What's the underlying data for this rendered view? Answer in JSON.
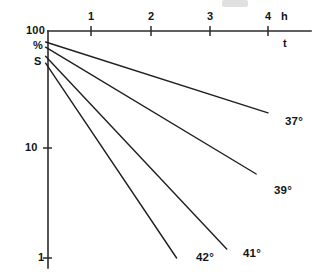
{
  "figure": {
    "kind": "semi-logarithmic-line-chart",
    "background_color": "#ffffff",
    "line_color": "#1f1f1f",
    "axis_color": "#2b2b2b",
    "top_edge_artifact": ""
  },
  "y_axis": {
    "scale": "log",
    "top_label": "100",
    "unit_label": "%",
    "quantity_label": "S",
    "tick_labels": [
      "100",
      "10",
      "1"
    ],
    "tick_values": [
      100,
      10,
      1
    ],
    "limits": [
      1,
      100
    ]
  },
  "x_axis": {
    "position": "top",
    "tick_labels": [
      "1",
      "2",
      "3",
      "4"
    ],
    "tick_values": [
      1,
      2,
      3,
      4
    ],
    "unit_label": "h",
    "variable_label": "t",
    "limits": [
      0,
      4.7
    ]
  },
  "series_labels": {
    "s37": "37°",
    "s39": "39°",
    "s41": "41°",
    "s42": "42°"
  },
  "chart_data": {
    "type": "line",
    "title": "",
    "subtitle": "",
    "xlabel": "t",
    "ylabel": "S",
    "x_unit": "h",
    "y_unit": "%",
    "yscale": "log",
    "xscale": "linear",
    "xlim": [
      0,
      4.7
    ],
    "ylim": [
      1,
      100
    ],
    "xticks": [
      1,
      2,
      3,
      4
    ],
    "yticks": [
      1,
      10,
      100
    ],
    "grid": false,
    "legend": "inline-right-end-labels",
    "x_axis_position": "top",
    "annotations": [
      "37°",
      "39°",
      "41°",
      "42°"
    ],
    "series": [
      {
        "name": "37°",
        "label": "37°",
        "x": [
          0.23,
          4.0
        ],
        "values": [
          80,
          19
        ]
      },
      {
        "name": "39°",
        "label": "39°",
        "x": [
          0.23,
          3.8
        ],
        "values": [
          72,
          5.5
        ]
      },
      {
        "name": "41°",
        "label": "41°",
        "x": [
          0.23,
          3.3
        ],
        "values": [
          60,
          1.2
        ]
      },
      {
        "name": "42°",
        "label": "42°",
        "x": [
          0.23,
          2.45
        ],
        "values": [
          52,
          1.0
        ]
      }
    ]
  }
}
